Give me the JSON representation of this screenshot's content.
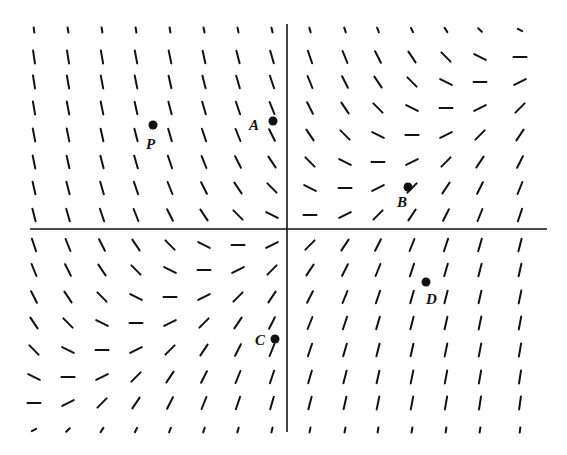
{
  "diagram": {
    "type": "slope_field",
    "colors": {
      "background": "#ffffff",
      "ink": "#111111"
    },
    "axes": {
      "origin_px": [
        287,
        229
      ],
      "x_axis": {
        "x1": 30,
        "x2": 547,
        "y": 229
      },
      "y_axis": {
        "x": 287,
        "y1": 24,
        "y2": 432
      }
    },
    "grid": {
      "cols_px": [
        34,
        68,
        102,
        136,
        170,
        204,
        238,
        272,
        310,
        345,
        378,
        412,
        446,
        480,
        520
      ],
      "col_units": [
        -7,
        -6,
        -5,
        -4,
        -3,
        -2,
        -1,
        0,
        1,
        2,
        3,
        4,
        5,
        6,
        7
      ],
      "rows_px": [
        30,
        57,
        82,
        108,
        135,
        162,
        188,
        215,
        245,
        270,
        297,
        323,
        350,
        377,
        403,
        430
      ],
      "row_units": [
        8,
        7,
        6,
        5,
        4,
        3,
        2,
        1,
        -1,
        -2,
        -3,
        -4,
        -5,
        -6,
        -7,
        -8
      ],
      "segment_length_px": 13,
      "short_rows": [
        8,
        -8
      ],
      "slope_rule": "dy/dx = (x - y) * 0.5 in grid units"
    },
    "points": [
      {
        "name": "P",
        "x": 153,
        "y": 125,
        "label": "P",
        "label_dx": -7,
        "label_dy": 12
      },
      {
        "name": "A",
        "x": 273,
        "y": 121,
        "label": "A",
        "label_dx": -24,
        "label_dy": -3
      },
      {
        "name": "B",
        "x": 408,
        "y": 187,
        "label": "B",
        "label_dx": -11,
        "label_dy": 8
      },
      {
        "name": "C",
        "x": 275,
        "y": 339,
        "label": "C",
        "label_dx": -20,
        "label_dy": -6
      },
      {
        "name": "D",
        "x": 426,
        "y": 282,
        "label": "D",
        "label_dx": 0,
        "label_dy": 10
      }
    ]
  }
}
